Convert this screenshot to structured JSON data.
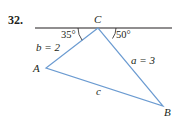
{
  "problem": {
    "number": "32."
  },
  "colors": {
    "triangle": "#6b9bd1",
    "baseline": "#231f20",
    "text": "#231f20"
  },
  "vertices": {
    "C": {
      "label": "C",
      "x": 98,
      "y": 28
    },
    "A": {
      "label": "A",
      "x": 46,
      "y": 68
    },
    "B": {
      "label": "B",
      "x": 163,
      "y": 106
    }
  },
  "sides": {
    "b": "b = 2",
    "a": "a = 3",
    "c": "c"
  },
  "angles": {
    "left": "35°",
    "right": "50°"
  }
}
